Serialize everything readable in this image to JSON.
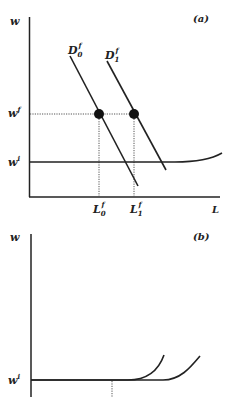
{
  "panel_a": {
    "tag": "(a)",
    "y_axis_label": "w",
    "x_axis_label": "L",
    "wage_labels": {
      "wf": {
        "base": "w",
        "sup": "f"
      },
      "wi": {
        "base": "w",
        "sup": "i"
      }
    },
    "demand_labels": {
      "d0": {
        "base": "D",
        "sub": "0",
        "sup": "f"
      },
      "d1": {
        "base": "D",
        "sub": "1",
        "sup": "f"
      }
    },
    "quantity_labels": {
      "l0": {
        "base": "L",
        "sub": "0",
        "sup": "f"
      },
      "l1": {
        "base": "L",
        "sub": "1",
        "sup": "f"
      }
    }
  },
  "panel_b": {
    "tag": "(b)",
    "y_axis_label": "w",
    "wage_labels": {
      "wi": {
        "base": "w",
        "sup": "i"
      }
    }
  },
  "colors": {
    "line": "#222222",
    "dotted": "#555555"
  }
}
